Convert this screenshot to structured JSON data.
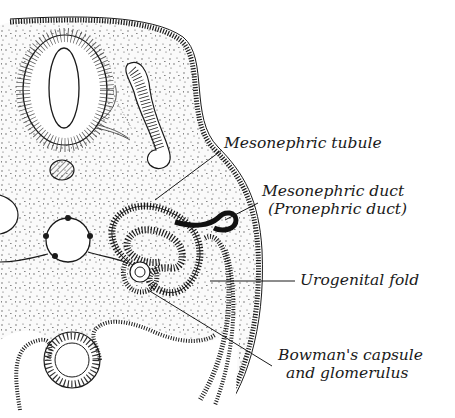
{
  "figure": {
    "type": "anatomical-cross-section",
    "labels": [
      {
        "id": "mesonephric-tubule",
        "lines": [
          "Mesonephric tubule"
        ],
        "x": 224,
        "y": 134
      },
      {
        "id": "mesonephric-duct",
        "lines": [
          "Mesonephric duct",
          "(Pronephric duct)"
        ],
        "x": 262,
        "y": 182
      },
      {
        "id": "urogenital-fold",
        "lines": [
          "Urogenital fold"
        ],
        "x": 300,
        "y": 271
      },
      {
        "id": "bowmans-capsule",
        "lines": [
          "Bowman's capsule",
          "and glomerulus"
        ],
        "x": 278,
        "y": 346
      }
    ],
    "colors": {
      "ink": "#1a1a1a",
      "paper": "#ffffff",
      "stipple": "#555555"
    }
  }
}
